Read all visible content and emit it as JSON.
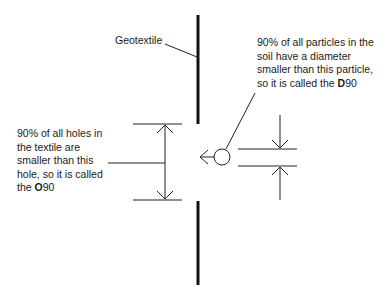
{
  "labels": {
    "geotextile": "Geotextile"
  },
  "right_note": {
    "lines": [
      "90% of all particles in the",
      "soil have a diameter",
      "smaller than this particle,",
      "so it is called the "
    ],
    "term_bold": "D",
    "term_suffix": "90"
  },
  "left_note": {
    "lines": [
      "90% of all holes in",
      "the textile are",
      "smaller than this",
      "hole, so it is called",
      "the "
    ],
    "term_bold": "O",
    "term_suffix": "90"
  },
  "colors": {
    "line": "#1a1a1a",
    "background": "#ffffff"
  }
}
